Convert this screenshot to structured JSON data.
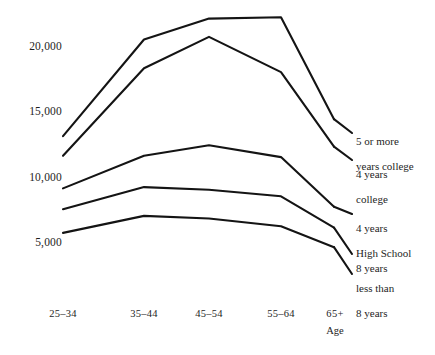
{
  "chart_data": {
    "type": "line",
    "title": "",
    "subtitle": "",
    "xlabel": "Age",
    "ylabel": "",
    "categories": [
      "25–34",
      "35–44",
      "45–54",
      "55–64",
      "65+"
    ],
    "yticks": [
      5000,
      10000,
      15000,
      20000
    ],
    "ytick_labels": [
      "5,000",
      "10,000",
      "15,000",
      "20,000"
    ],
    "ylim": [
      3200,
      23000
    ],
    "grid": false,
    "legend_position": "right-inline",
    "annotations": [
      "Age"
    ],
    "series": [
      {
        "name": "5 or more years college",
        "label_lines": [
          "5 or more",
          "years college"
        ],
        "values": [
          13100,
          20500,
          22100,
          22200,
          14400
        ]
      },
      {
        "name": "4 years college",
        "label_lines": [
          "4 years",
          "college"
        ],
        "values": [
          11600,
          18300,
          20700,
          18000,
          12300
        ]
      },
      {
        "name": "4 years High School",
        "label_lines": [
          "4 years",
          "High School"
        ],
        "values": [
          9100,
          11600,
          12400,
          11500,
          7700
        ]
      },
      {
        "name": "8 years",
        "label_lines": [
          "8 years"
        ],
        "values": [
          7500,
          9200,
          9000,
          8500,
          6100
        ]
      },
      {
        "name": "less than 8 years",
        "label_lines": [
          "less than",
          "8 years"
        ],
        "values": [
          5700,
          7000,
          6800,
          6200,
          4600
        ]
      }
    ]
  },
  "axis": {
    "x_title": "Age",
    "x_labels": [
      "25–34",
      "35–44",
      "45–54",
      "55–64",
      "65+"
    ],
    "y_labels": [
      "20,000",
      "15,000",
      "10,000",
      "5,000"
    ]
  },
  "legend": {
    "items": [
      {
        "line1": "5 or more",
        "line2": "years college"
      },
      {
        "line1": "4 years",
        "line2": "college"
      },
      {
        "line1": "4 years",
        "line2": "High School"
      },
      {
        "line1": "8 years",
        "line2": ""
      },
      {
        "line1": "less than",
        "line2": "8 years"
      }
    ]
  },
  "style": {
    "line_color": "#141414",
    "text_color": "#1e1e1e",
    "background": "#ffffff"
  }
}
